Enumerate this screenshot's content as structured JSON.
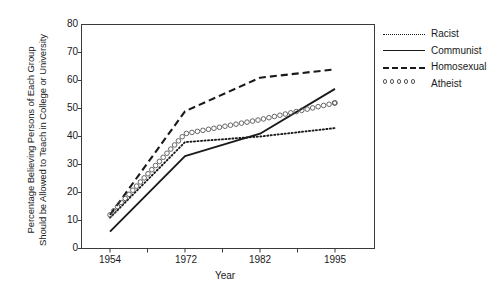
{
  "chart_data": {
    "type": "line",
    "title": "",
    "xlabel": "Year",
    "ylabel": "Percentage Believing Persons of Each Group Should be Allowed to Teach in College or University",
    "ylabel_line1": "Percentage Believing Persons of Each Group",
    "ylabel_line2": "Should be Allowed to Teach in College or University",
    "x": [
      1954,
      1972,
      1982,
      1995
    ],
    "categories": [
      "1954",
      "1972",
      "1982",
      "1995"
    ],
    "xtick_labels": [
      "1954",
      "1972",
      "1982",
      "1995"
    ],
    "ytick_labels": [
      "0",
      "10",
      "20",
      "30",
      "40",
      "50",
      "60",
      "70",
      "80"
    ],
    "ylim": [
      0,
      80
    ],
    "ytick_step": 10,
    "xlim": [
      1954,
      1995
    ],
    "grid": false,
    "legend_position": "right",
    "series": [
      {
        "name": "Racist",
        "style": "dotted",
        "values": [
          11,
          38,
          40,
          43
        ]
      },
      {
        "name": "Communist",
        "style": "solid",
        "values": [
          6,
          33,
          41,
          57
        ]
      },
      {
        "name": "Homosexual",
        "style": "dashed",
        "values": [
          12,
          49,
          61,
          64
        ]
      },
      {
        "name": "Atheist",
        "style": "circles",
        "values": [
          12,
          41,
          46,
          52
        ]
      }
    ]
  },
  "axes": {
    "x_title": "Year",
    "y_title_line1": "Percentage Believing Persons of Each Group",
    "y_title_line2": "Should be Allowed to Teach in College or University"
  },
  "legend": {
    "items": [
      {
        "label": "Racist",
        "style": "dotted"
      },
      {
        "label": "Communist",
        "style": "solid"
      },
      {
        "label": "Homosexual",
        "style": "dashed"
      },
      {
        "label": "Atheist",
        "style": "circles"
      }
    ]
  },
  "colors": {
    "ink": "#1a1a1a",
    "axis": "#3a3a3a",
    "marker_outline": "#555555",
    "background": "#ffffff"
  }
}
